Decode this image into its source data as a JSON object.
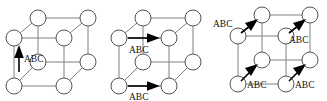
{
  "figure": {
    "type": "diagram",
    "background_color": "#ffffff",
    "edge_color": "#808080",
    "node_stroke_color": "#555555",
    "node_fill_color": "#ffffff",
    "arrow_color": "#000000",
    "label_color": "#111111",
    "message_label": "ABC",
    "node_count_per_cube": 8,
    "panels": [
      {
        "name": "cube-step-1",
        "arrow_count": 1,
        "arrows": [
          {
            "name": "arrow-up-front-left",
            "label": "ABC",
            "direction": "up"
          }
        ]
      },
      {
        "name": "cube-step-2",
        "arrow_count": 2,
        "arrows": [
          {
            "name": "arrow-right-back-upper",
            "label": "ABC",
            "direction": "right"
          },
          {
            "name": "arrow-right-front-lower",
            "label": "ABC",
            "direction": "right"
          }
        ]
      },
      {
        "name": "cube-step-3",
        "arrow_count": 4,
        "arrows": [
          {
            "name": "arrow-diag-upper-left",
            "label": "ABC",
            "direction": "up-right"
          },
          {
            "name": "arrow-diag-upper-right",
            "label": "ABC",
            "direction": "up-right"
          },
          {
            "name": "arrow-diag-lower-left",
            "label": "ABC",
            "direction": "up-right"
          },
          {
            "name": "arrow-diag-lower-right",
            "label": "ABC",
            "direction": "up-right"
          }
        ]
      }
    ]
  }
}
